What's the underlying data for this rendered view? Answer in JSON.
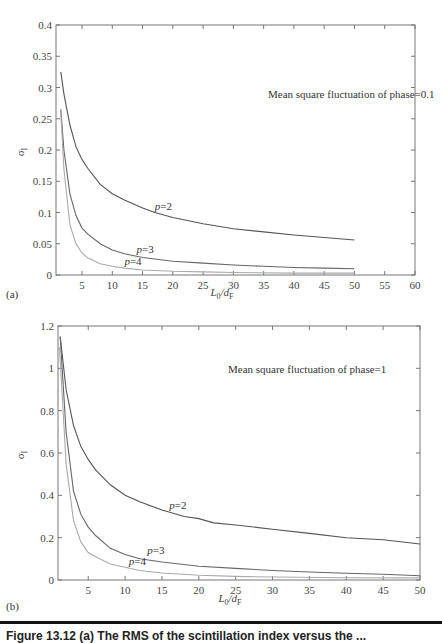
{
  "chart_data": [
    {
      "panel": "(a)",
      "type": "line",
      "title": "",
      "annotation": "Mean square fluctuation of phase = 0.1",
      "xlabel": "L0/dF",
      "ylabel": "σI",
      "xlim": [
        0.7,
        60
      ],
      "ylim": [
        0,
        0.4
      ],
      "xticks": [
        5,
        10,
        15,
        20,
        25,
        30,
        35,
        40,
        45,
        50,
        55,
        60
      ],
      "yticks": [
        0,
        0.05,
        0.1,
        0.15,
        0.2,
        0.25,
        0.3,
        0.35,
        0.4
      ],
      "grid": false,
      "series": [
        {
          "name": "p = 2",
          "color": "#555555",
          "x": [
            1.5,
            2,
            3,
            4,
            5,
            6,
            8,
            10,
            12,
            15,
            17,
            20,
            25,
            30,
            35,
            40,
            45,
            50
          ],
          "y": [
            0.325,
            0.29,
            0.24,
            0.205,
            0.185,
            0.17,
            0.145,
            0.13,
            0.12,
            0.107,
            0.1,
            0.092,
            0.082,
            0.074,
            0.069,
            0.064,
            0.06,
            0.056
          ]
        },
        {
          "name": "p = 3",
          "color": "#666666",
          "x": [
            1.5,
            2,
            3,
            4,
            5,
            6,
            8,
            10,
            12,
            15,
            20,
            25,
            30,
            35,
            40,
            45,
            50
          ],
          "y": [
            0.265,
            0.2,
            0.13,
            0.095,
            0.075,
            0.065,
            0.05,
            0.04,
            0.034,
            0.028,
            0.022,
            0.019,
            0.016,
            0.014,
            0.012,
            0.011,
            0.01
          ]
        },
        {
          "name": "p = 4",
          "color": "#aaaaaa",
          "x": [
            1.5,
            2,
            3,
            4,
            5,
            6,
            8,
            10,
            12,
            15,
            20,
            25,
            30,
            40,
            50
          ],
          "y": [
            0.26,
            0.17,
            0.08,
            0.05,
            0.035,
            0.027,
            0.018,
            0.014,
            0.011,
            0.008,
            0.006,
            0.005,
            0.004,
            0.003,
            0.003
          ]
        }
      ],
      "curve_labels": [
        {
          "text": "p = 2",
          "x": 17,
          "y": 0.1
        },
        {
          "text": "p = 3",
          "x": 14,
          "y": 0.03
        },
        {
          "text": "p = 4",
          "x": 12,
          "y": 0.012
        }
      ]
    },
    {
      "panel": "(b)",
      "type": "line",
      "title": "",
      "annotation": "Mean square fluctuation of phase = 1",
      "xlabel": "L0/dF",
      "ylabel": "σI",
      "xlim": [
        0.9,
        50
      ],
      "ylim": [
        0,
        1.2
      ],
      "xticks": [
        5,
        10,
        15,
        20,
        25,
        30,
        35,
        40,
        45,
        50
      ],
      "yticks": [
        0,
        0.2,
        0.4,
        0.6,
        0.8,
        1,
        1.2
      ],
      "grid": false,
      "series": [
        {
          "name": "p = 2",
          "color": "#555555",
          "x": [
            1.2,
            2,
            3,
            4,
            5,
            6,
            8,
            10,
            12,
            15,
            18,
            20,
            22,
            25,
            30,
            35,
            40,
            45,
            50
          ],
          "y": [
            1.15,
            0.9,
            0.73,
            0.63,
            0.57,
            0.52,
            0.45,
            0.4,
            0.37,
            0.33,
            0.3,
            0.29,
            0.27,
            0.26,
            0.24,
            0.22,
            0.2,
            0.19,
            0.17
          ]
        },
        {
          "name": "p = 3",
          "color": "#666666",
          "x": [
            1.2,
            2,
            3,
            4,
            5,
            6,
            8,
            10,
            12,
            15,
            20,
            25,
            30,
            35,
            40,
            45,
            50
          ],
          "y": [
            1.15,
            0.7,
            0.42,
            0.31,
            0.25,
            0.21,
            0.15,
            0.12,
            0.1,
            0.085,
            0.065,
            0.055,
            0.045,
            0.038,
            0.032,
            0.027,
            0.02
          ]
        },
        {
          "name": "p = 4",
          "color": "#aaaaaa",
          "x": [
            1.1,
            2,
            3,
            4,
            5,
            6,
            8,
            10,
            12,
            15,
            20,
            25,
            30,
            40,
            50
          ],
          "y": [
            1.1,
            0.55,
            0.28,
            0.18,
            0.13,
            0.11,
            0.075,
            0.06,
            0.045,
            0.033,
            0.022,
            0.017,
            0.014,
            0.011,
            0.01
          ]
        }
      ],
      "curve_labels": [
        {
          "text": "p = 2",
          "x": 16,
          "y": 0.32
        },
        {
          "text": "p = 3",
          "x": 13,
          "y": 0.11
        },
        {
          "text": "p = 4",
          "x": 10.5,
          "y": 0.055
        }
      ]
    }
  ],
  "panels": {
    "a": {
      "label": "(a)",
      "annotation": "Mean square fluctuation of phase = 0.1",
      "ylabel": "σ",
      "ylabel_sub": "I",
      "xlabel_main": "L",
      "xlabel_sub1": "0",
      "xlabel_mid": "/d",
      "xlabel_sub2": "F"
    },
    "b": {
      "label": "(b)",
      "annotation": "Mean square fluctuation of phase = 1",
      "ylabel": "σ",
      "ylabel_sub": "I",
      "xlabel_main": "L",
      "xlabel_sub1": "0",
      "xlabel_mid": "/d",
      "xlabel_sub2": "F"
    }
  },
  "caption": "Figure 13.12   (a) The RMS of the scintillation index versus the ..."
}
